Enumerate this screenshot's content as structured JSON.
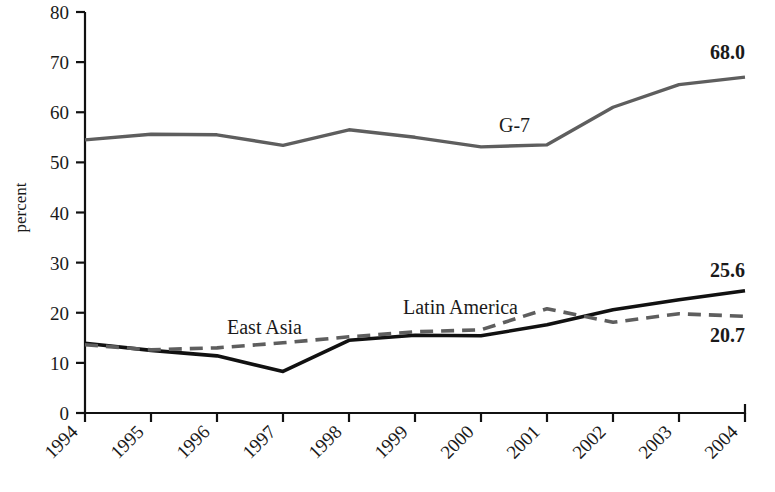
{
  "chart_data": {
    "type": "line",
    "title": "",
    "xlabel": "",
    "ylabel": "percent",
    "ylim": [
      0,
      80
    ],
    "yticks": [
      0,
      10,
      20,
      30,
      40,
      50,
      60,
      70,
      80
    ],
    "ytick_labels": [
      "0",
      "10",
      "20",
      "30",
      "40",
      "50",
      "60",
      "70",
      "80"
    ],
    "grid": false,
    "legend": "inline-annotations",
    "x": [
      1994,
      1995,
      1996,
      1997,
      1998,
      1999,
      2000,
      2001,
      2002,
      2003,
      2004
    ],
    "categories": [
      "1994",
      "1995",
      "1996",
      "1997",
      "1998",
      "1999",
      "2000",
      "2001",
      "2002",
      "2003",
      "2004"
    ],
    "series": [
      {
        "name": "G-7",
        "style": "solid",
        "color": "#5e5e5e",
        "width": 3.4,
        "values": [
          54.5,
          55.6,
          55.5,
          53.4,
          56.5,
          55.0,
          53.1,
          53.5,
          61.0,
          65.5,
          67.0
        ],
        "end_label": "68.0",
        "label_text": "G-7"
      },
      {
        "name": "East Asia",
        "style": "solid",
        "color": "#111111",
        "width": 3.6,
        "values": [
          13.9,
          12.5,
          11.4,
          8.3,
          14.5,
          15.5,
          15.4,
          17.6,
          20.6,
          22.6,
          24.4
        ],
        "end_label": "25.6",
        "label_text": "East Asia"
      },
      {
        "name": "Latin America",
        "style": "dashed",
        "color": "#5e5e5e",
        "width": 3.6,
        "values": [
          13.6,
          12.6,
          13.0,
          14.0,
          15.2,
          16.2,
          16.6,
          20.8,
          18.1,
          19.8,
          19.3
        ],
        "end_label": "20.7",
        "label_text": "Latin America"
      }
    ],
    "annotations": [
      {
        "name": "g7-label",
        "text": "G-7"
      },
      {
        "name": "east-asia-label",
        "text": "East Asia"
      },
      {
        "name": "latin-america-label",
        "text": "Latin America"
      },
      {
        "name": "g7-end-value",
        "text": "68.0"
      },
      {
        "name": "east-asia-end-value",
        "text": "25.6"
      },
      {
        "name": "latin-america-end-value",
        "text": "20.7"
      }
    ]
  },
  "axis": {
    "y_title": "percent",
    "y_labels": [
      "80",
      "70",
      "60",
      "50",
      "40",
      "30",
      "20",
      "10",
      "0"
    ],
    "x_labels": [
      "1994",
      "1995",
      "1996",
      "1997",
      "1998",
      "1999",
      "2000",
      "2001",
      "2002",
      "2003",
      "2004"
    ]
  },
  "annotations": {
    "g7": "G-7",
    "east_asia": "East Asia",
    "latin_america": "Latin America",
    "g7_value": "68.0",
    "east_asia_value": "25.6",
    "latin_america_value": "20.7"
  },
  "colors": {
    "g7_line": "#5e5e5e",
    "east_asia_line": "#111111",
    "latin_america_line": "#5e5e5e",
    "axis": "#111111",
    "background": "#ffffff"
  },
  "header": {
    "clipped_title": ""
  }
}
